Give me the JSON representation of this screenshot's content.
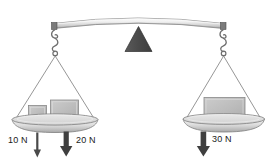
{
  "diagram": {
    "fulcrum": {
      "name": "triangular-fulcrum",
      "color": "#4d4d4d"
    },
    "beam": {
      "name": "balance-beam",
      "color": "#e8e8e8",
      "edge_color": "#6b6b6b"
    },
    "pans": [
      {
        "side": "left",
        "name": "left-pan",
        "color": "#d6d6d6"
      },
      {
        "side": "right",
        "name": "right-pan",
        "color": "#d6d6d6"
      }
    ],
    "blocks": [
      {
        "side": "left",
        "name": "left-small-block",
        "color": "#b3b3b3"
      },
      {
        "side": "left",
        "name": "left-large-block",
        "color": "#b8b8b8"
      },
      {
        "side": "right",
        "name": "right-block",
        "color": "#bdbdbd"
      }
    ],
    "forces": [
      {
        "id": "left-small",
        "label": "10 N",
        "arrow": "thin-down-arrow",
        "value": 10,
        "unit": "N"
      },
      {
        "id": "left-large",
        "label": "20 N",
        "arrow": "thick-down-arrow",
        "value": 20,
        "unit": "N"
      },
      {
        "id": "right",
        "label": "30 N",
        "arrow": "thick-down-arrow",
        "value": 30,
        "unit": "N"
      }
    ]
  }
}
